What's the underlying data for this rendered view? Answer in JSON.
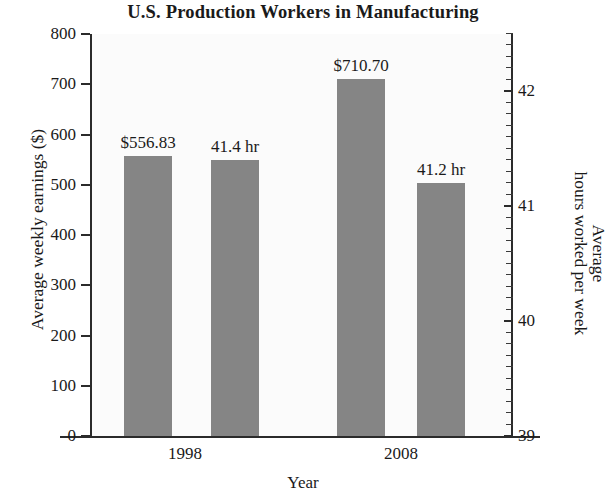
{
  "chart_data": {
    "type": "bar",
    "title": "U.S. Production Workers in Manufacturing",
    "xlabel": "Year",
    "ylabel": "Average weekly earnings ($)",
    "ylabel_right_line1": "Average",
    "ylabel_right_line2": "hours worked per week",
    "ylabel_right": "Average hours worked per week",
    "categories": [
      "1998",
      "2008"
    ],
    "grid": false,
    "legend": "none",
    "series": [
      {
        "name": "Average weekly earnings ($)",
        "axis": "left",
        "unit": "$",
        "values": [
          556.83,
          710.7
        ],
        "data_labels": [
          "$556.83",
          "$710.70"
        ]
      },
      {
        "name": "Average hours worked per week",
        "axis": "right",
        "unit": "hr",
        "values": [
          41.4,
          41.2
        ],
        "data_labels": [
          "41.4 hr",
          "41.2 hr"
        ]
      }
    ],
    "yaxis_left": {
      "label": "Average weekly earnings ($)",
      "min": 0,
      "max": 800,
      "tick_step": 100,
      "ticks": [
        0,
        100,
        200,
        300,
        400,
        500,
        600,
        700,
        800
      ],
      "tick_labels": [
        "0",
        "100",
        "200",
        "300",
        "400",
        "500",
        "600",
        "700",
        "800"
      ]
    },
    "yaxis_right": {
      "label": "Average hours worked per week",
      "min": 39,
      "max": 42.5,
      "major_ticks": [
        39,
        40,
        41,
        42
      ],
      "major_tick_labels": [
        "39",
        "40",
        "41",
        "42"
      ],
      "minor_tick_step": 0.1
    },
    "bars": [
      {
        "category": "1998",
        "series": "earnings",
        "value": 556.83,
        "label": "$556.83",
        "color": "#858585"
      },
      {
        "category": "1998",
        "series": "hours",
        "value": 41.4,
        "label": "41.4 hr",
        "color": "#858585"
      },
      {
        "category": "2008",
        "series": "earnings",
        "value": 710.7,
        "label": "$710.70",
        "color": "#858585"
      },
      {
        "category": "2008",
        "series": "hours",
        "value": 41.2,
        "label": "41.2 hr",
        "color": "#858585"
      }
    ],
    "colors": {
      "bar": "#858585",
      "axis": "#2b2b2b",
      "text": "#1a1a1a",
      "plot_background": "#fbfbfb",
      "page_background": "#ffffff"
    }
  }
}
